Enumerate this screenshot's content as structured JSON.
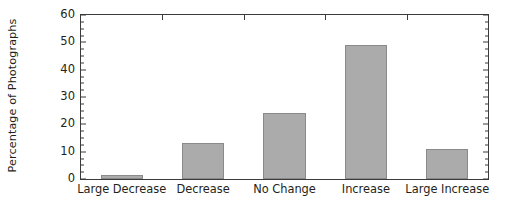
{
  "chart_data": {
    "type": "bar",
    "title": "",
    "xlabel": "",
    "ylabel": "Percentage of Photographs",
    "categories": [
      "Large Decrease",
      "Decrease",
      "No Change",
      "Increase",
      "Large Increase"
    ],
    "values": [
      1.5,
      13,
      24,
      49,
      11
    ],
    "series": [
      {
        "name": "Percentage of Photographs",
        "values": [
          1.5,
          13,
          24,
          49,
          11
        ]
      }
    ],
    "ylim": [
      0,
      60
    ],
    "y_major_ticks": [
      0,
      10,
      20,
      30,
      40,
      50,
      60
    ],
    "y_tick_labels": [
      "0",
      "10",
      "20",
      "30",
      "40",
      "50",
      "60"
    ],
    "y_minor_tick_step": 2.5,
    "grid": false,
    "legend": false,
    "legend_position": "none",
    "bar_fill_color": "#ababab",
    "bar_border_color": "#8a8a8a",
    "axis_color": "#3b3b3b",
    "text_color": "#231f20",
    "background_color": "#ffffff"
  }
}
